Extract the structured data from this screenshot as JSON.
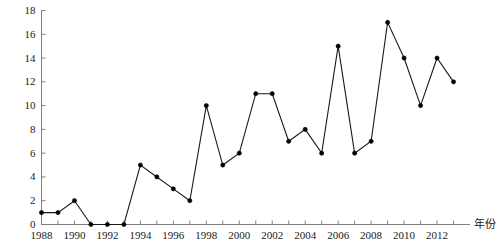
{
  "chart_data": {
    "type": "line",
    "title": "",
    "xlabel": "年份",
    "ylabel": "申请量/件",
    "x": [
      1988,
      1989,
      1990,
      1991,
      1992,
      1993,
      1994,
      1995,
      1996,
      1997,
      1998,
      1999,
      2000,
      2001,
      2002,
      2003,
      2004,
      2005,
      2006,
      2007,
      2008,
      2009,
      2010,
      2011,
      2012,
      2013
    ],
    "values": [
      1,
      1,
      2,
      0,
      0,
      0,
      5,
      4,
      3,
      2,
      10,
      5,
      6,
      11,
      11,
      7,
      8,
      6,
      15,
      6,
      7,
      17,
      14,
      10,
      14,
      12
    ],
    "series": [
      {
        "name": "申请量",
        "values": [
          1,
          1,
          2,
          0,
          0,
          0,
          5,
          4,
          3,
          2,
          10,
          5,
          6,
          11,
          11,
          7,
          8,
          6,
          15,
          6,
          7,
          17,
          14,
          10,
          14,
          12
        ]
      }
    ],
    "xlim": [
      1988,
      2014
    ],
    "ylim": [
      0,
      18
    ],
    "ytick_values": [
      0,
      2,
      4,
      6,
      8,
      10,
      12,
      14,
      16,
      18
    ],
    "ytick_labels": [
      "0",
      "2",
      "4",
      "6",
      "8",
      "10",
      "12",
      "14",
      "16",
      "18"
    ],
    "xtick_values": [
      1988,
      1990,
      1992,
      1994,
      1996,
      1998,
      2000,
      2002,
      2004,
      2006,
      2008,
      2010,
      2012
    ],
    "xtick_labels": [
      "1988",
      "1990",
      "1992",
      "1994",
      "1996",
      "1998",
      "2000",
      "2002",
      "2004",
      "2006",
      "2008",
      "2010",
      "2012"
    ],
    "grid": false,
    "legend": false,
    "legend_position": "none",
    "line_color": "#1a1a1a",
    "marker": "circle",
    "marker_color": "#000000",
    "axis_color": "#808080"
  }
}
